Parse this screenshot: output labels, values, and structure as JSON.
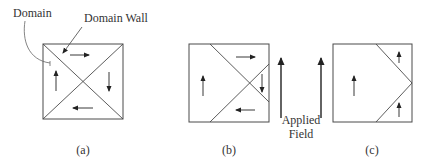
{
  "figure": {
    "labels": {
      "domain": "Domain",
      "domain_wall": "Domain Wall",
      "applied_field_line1": "Applied",
      "applied_field_line2": "Field"
    },
    "panels": [
      {
        "id": "a",
        "caption": "(a)",
        "description": "Four triangular domains with closed-loop magnetization (up, right, down, left), no applied field"
      },
      {
        "id": "b",
        "caption": "(b)",
        "description": "Up-magnetized domain grows as domain walls shift right under applied field"
      },
      {
        "id": "c",
        "caption": "(c)",
        "description": "All domains magnetized upward; walls form a chevron at right edge"
      }
    ],
    "colors": {
      "line": "#4a4a4a",
      "arrow": "#222222",
      "text": "#333333",
      "background": "#ffffff"
    }
  }
}
